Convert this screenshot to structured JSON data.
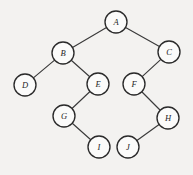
{
  "figure": {
    "kind": "binary-tree-diagram",
    "width": 193,
    "height": 175,
    "background_color": "#f3f2f0",
    "node_fill_color": "#fbfbfa",
    "node_stroke_color": "#2a2a2a",
    "edge_color": "#3a3a3a",
    "label_color": "#1e1e1e",
    "node_radius": 11
  },
  "nodes": [
    {
      "id": "A",
      "label": "A",
      "cx": 116,
      "cy": 22,
      "r": 11
    },
    {
      "id": "B",
      "label": "B",
      "cx": 63,
      "cy": 53,
      "r": 11
    },
    {
      "id": "C",
      "label": "C",
      "cx": 169,
      "cy": 52,
      "r": 11
    },
    {
      "id": "D",
      "label": "D",
      "cx": 25,
      "cy": 85,
      "r": 11
    },
    {
      "id": "E",
      "label": "E",
      "cx": 98,
      "cy": 84,
      "r": 11
    },
    {
      "id": "F",
      "label": "F",
      "cx": 134,
      "cy": 84,
      "r": 11
    },
    {
      "id": "G",
      "label": "G",
      "cx": 64,
      "cy": 116,
      "r": 11
    },
    {
      "id": "H",
      "label": "H",
      "cx": 168,
      "cy": 118,
      "r": 11
    },
    {
      "id": "I",
      "label": "I",
      "cx": 99,
      "cy": 147,
      "r": 11
    },
    {
      "id": "J",
      "label": "J",
      "cx": 128,
      "cy": 147,
      "r": 11
    }
  ],
  "edges": [
    {
      "from": "A",
      "to": "B",
      "x1": 116,
      "y1": 22,
      "x2": 63,
      "y2": 53
    },
    {
      "from": "A",
      "to": "C",
      "x1": 116,
      "y1": 22,
      "x2": 169,
      "y2": 52
    },
    {
      "from": "B",
      "to": "D",
      "x1": 63,
      "y1": 53,
      "x2": 25,
      "y2": 85
    },
    {
      "from": "B",
      "to": "E",
      "x1": 63,
      "y1": 53,
      "x2": 98,
      "y2": 84
    },
    {
      "from": "C",
      "to": "F",
      "x1": 169,
      "y1": 52,
      "x2": 134,
      "y2": 84
    },
    {
      "from": "E",
      "to": "G",
      "x1": 98,
      "y1": 84,
      "x2": 64,
      "y2": 116
    },
    {
      "from": "F",
      "to": "H",
      "x1": 134,
      "y1": 84,
      "x2": 168,
      "y2": 118
    },
    {
      "from": "G",
      "to": "I",
      "x1": 64,
      "y1": 116,
      "x2": 99,
      "y2": 147
    },
    {
      "from": "H",
      "to": "J",
      "x1": 168,
      "y1": 118,
      "x2": 128,
      "y2": 147
    }
  ]
}
